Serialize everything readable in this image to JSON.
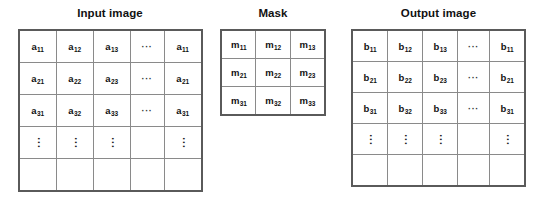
{
  "figure": {
    "type": "convolution-mask-diagram",
    "panels": [
      {
        "id": "input",
        "title": "Input image",
        "grid": {
          "rows": 5,
          "cols": 5,
          "cells": [
            [
              {
                "base": "a",
                "sub": "11"
              },
              {
                "base": "a",
                "sub": "12"
              },
              {
                "base": "a",
                "sub": "13"
              },
              {
                "dots": "···"
              },
              {
                "base": "a",
                "sub": "11"
              }
            ],
            [
              {
                "base": "a",
                "sub": "21"
              },
              {
                "base": "a",
                "sub": "22"
              },
              {
                "base": "a",
                "sub": "23"
              },
              {
                "dots": "···"
              },
              {
                "base": "a",
                "sub": "21"
              }
            ],
            [
              {
                "base": "a",
                "sub": "31"
              },
              {
                "base": "a",
                "sub": "32"
              },
              {
                "base": "a",
                "sub": "33"
              },
              {
                "dots": "···"
              },
              {
                "base": "a",
                "sub": "31"
              }
            ],
            [
              {
                "vdots": "···"
              },
              {
                "vdots": "···"
              },
              {
                "vdots": "···"
              },
              {
                "empty": true
              },
              {
                "vdots": "···"
              }
            ],
            [
              {
                "empty": true
              },
              {
                "empty": true
              },
              {
                "empty": true
              },
              {
                "empty": true
              },
              {
                "empty": true
              }
            ]
          ],
          "highlight": {
            "label": "neighborhood-region",
            "row_start": 0,
            "row_end": 2,
            "col_start": 0,
            "col_end": 2
          }
        }
      },
      {
        "id": "mask",
        "title": "Mask",
        "grid": {
          "rows": 3,
          "cols": 3,
          "cells": [
            [
              {
                "base": "m",
                "sub": "11"
              },
              {
                "base": "m",
                "sub": "12"
              },
              {
                "base": "m",
                "sub": "13"
              }
            ],
            [
              {
                "base": "m",
                "sub": "21"
              },
              {
                "base": "m",
                "sub": "22"
              },
              {
                "base": "m",
                "sub": "23"
              }
            ],
            [
              {
                "base": "m",
                "sub": "31"
              },
              {
                "base": "m",
                "sub": "32"
              },
              {
                "base": "m",
                "sub": "33"
              }
            ]
          ]
        }
      },
      {
        "id": "output",
        "title": "Output image",
        "grid": {
          "rows": 5,
          "cols": 5,
          "cells": [
            [
              {
                "base": "b",
                "sub": "11"
              },
              {
                "base": "b",
                "sub": "12"
              },
              {
                "base": "b",
                "sub": "13"
              },
              {
                "dots": "···"
              },
              {
                "base": "b",
                "sub": "11"
              }
            ],
            [
              {
                "base": "b",
                "sub": "21"
              },
              {
                "base": "b",
                "sub": "22"
              },
              {
                "base": "b",
                "sub": "23"
              },
              {
                "dots": "···"
              },
              {
                "base": "b",
                "sub": "21"
              }
            ],
            [
              {
                "base": "b",
                "sub": "31"
              },
              {
                "base": "b",
                "sub": "32"
              },
              {
                "base": "b",
                "sub": "33"
              },
              {
                "dots": "···"
              },
              {
                "base": "b",
                "sub": "31"
              }
            ],
            [
              {
                "vdots": "···"
              },
              {
                "vdots": "···"
              },
              {
                "vdots": "···"
              },
              {
                "empty": true
              },
              {
                "vdots": "···"
              }
            ],
            [
              {
                "empty": true
              },
              {
                "empty": true
              },
              {
                "empty": true
              },
              {
                "empty": true
              },
              {
                "empty": true
              }
            ]
          ],
          "highlight": {
            "label": "result-pixel",
            "row_start": 1,
            "row_end": 1,
            "col_start": 1,
            "col_end": 1
          }
        }
      }
    ],
    "colors": {
      "background": "#ffffff",
      "grid_line": "#8a8a8a",
      "grid_border": "#5a5a5a",
      "highlight_border": "#3a3a3a",
      "text": "#111111"
    }
  }
}
